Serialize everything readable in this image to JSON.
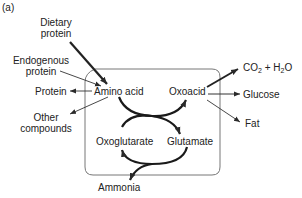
{
  "panel_label": "(a)",
  "nodes": {
    "dietary_protein": [
      "Dietary",
      "protein"
    ],
    "endogenous_protein": [
      "Endogenous",
      "protein"
    ],
    "protein": "Protein",
    "amino_acid": "Amino acid",
    "other_compounds": [
      "Other",
      "compounds"
    ],
    "oxoacid": "Oxoacid",
    "oxoglutarate": "Oxoglutarate",
    "glutamate": "Glutamate",
    "ammonia": "Ammonia",
    "co2_h2o": {
      "co": "CO",
      "sub1": "2",
      "mid": " + H",
      "sub2": "2",
      "end": "O"
    },
    "glucose": "Glucose",
    "fat": "Fat"
  },
  "colors": {
    "line": "#2a2a2a",
    "box": "#777777",
    "text": "#222222"
  }
}
